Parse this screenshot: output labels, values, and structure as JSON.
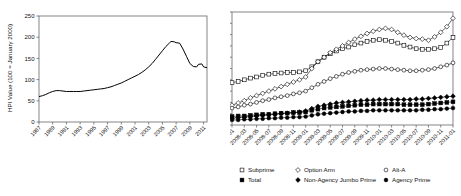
{
  "figure": {
    "panels": [
      "left-hpi-chart",
      "right-delinquency-chart"
    ]
  },
  "chart_data": [
    {
      "id": "hpi",
      "type": "line",
      "title": "",
      "xlabel": "",
      "ylabel": "HPI Value (100 = January 2000)",
      "ylim": [
        0,
        250
      ],
      "yticks": [
        "0",
        "50",
        "100",
        "150",
        "200",
        "250"
      ],
      "xticks": [
        "1987",
        "1989",
        "1991",
        "1993",
        "1995",
        "1997",
        "1999",
        "2001",
        "2003",
        "2005",
        "2007",
        "2009",
        "2011"
      ],
      "grid": false,
      "legend": "none",
      "x": [
        1987,
        1987.5,
        1988,
        1988.5,
        1989,
        1989.5,
        1990,
        1990.5,
        1991,
        1991.5,
        1992,
        1992.5,
        1993,
        1993.5,
        1994,
        1994.5,
        1995,
        1995.5,
        1996,
        1996.5,
        1997,
        1997.5,
        1998,
        1998.5,
        1999,
        1999.5,
        2000,
        2000.5,
        2001,
        2001.5,
        2002,
        2002.5,
        2003,
        2003.5,
        2004,
        2004.5,
        2005,
        2005.5,
        2006,
        2006.25,
        2006.75,
        2007,
        2007.5,
        2008,
        2008.5,
        2009,
        2009.5,
        2010,
        2010.25,
        2010.75,
        2011,
        2011.5
      ],
      "values": [
        60,
        62,
        65,
        69,
        72,
        74,
        74,
        73,
        72,
        72,
        72,
        72,
        72,
        73,
        74,
        75,
        76,
        77,
        78,
        79,
        81,
        83,
        86,
        89,
        92,
        96,
        100,
        104,
        108,
        112,
        117,
        123,
        130,
        138,
        148,
        158,
        168,
        178,
        186,
        190,
        189,
        187,
        186,
        172,
        155,
        138,
        131,
        130,
        136,
        137,
        130,
        128
      ],
      "series": [
        {
          "name": "HPI",
          "marker": "none",
          "style": "solid"
        }
      ]
    },
    {
      "id": "delinquency",
      "type": "line",
      "title": "",
      "xlabel": "",
      "ylabel": "",
      "ylim": [
        0,
        0.2
      ],
      "yticks": [
        "0%",
        "2%",
        "4%",
        "6%",
        "8%",
        "10%",
        "12%",
        "14%",
        "16%",
        "18%",
        "20%"
      ],
      "xticks": [
        "2008-01",
        "2008-03",
        "2008-05",
        "2008-07",
        "2008-09",
        "2008-11",
        "2009-01",
        "2009-03",
        "2009-05",
        "2009-07",
        "2009-09",
        "2009-11",
        "2010-01",
        "2010-03",
        "2010-05",
        "2010-07",
        "2010-09",
        "2010-11",
        "2011-01"
      ],
      "x": [
        "2008-01",
        "2008-02",
        "2008-03",
        "2008-04",
        "2008-05",
        "2008-06",
        "2008-07",
        "2008-08",
        "2008-09",
        "2008-10",
        "2008-11",
        "2008-12",
        "2009-01",
        "2009-02",
        "2009-03",
        "2009-04",
        "2009-05",
        "2009-06",
        "2009-07",
        "2009-08",
        "2009-09",
        "2009-10",
        "2009-11",
        "2009-12",
        "2010-01",
        "2010-02",
        "2010-03",
        "2010-04",
        "2010-05",
        "2010-06",
        "2010-07",
        "2010-08",
        "2010-09",
        "2010-10",
        "2010-11",
        "2010-12",
        "2011-01"
      ],
      "grid": false,
      "legend": "bottom",
      "series": [
        {
          "name": "Subprime",
          "marker": "open-square",
          "values": [
            7.5,
            7.7,
            8.0,
            8.3,
            8.5,
            8.8,
            9.0,
            9.1,
            9.2,
            9.3,
            9.3,
            9.4,
            9.6,
            10.3,
            11.2,
            12.0,
            12.6,
            13.1,
            13.5,
            13.8,
            14.2,
            14.5,
            14.8,
            15.0,
            15.1,
            15.0,
            14.8,
            14.5,
            14.1,
            13.8,
            13.5,
            13.4,
            13.4,
            13.5,
            13.7,
            14.5,
            15.5
          ]
        },
        {
          "name": "Option Arm",
          "marker": "open-diamond",
          "values": [
            3.5,
            3.9,
            4.3,
            4.8,
            5.2,
            5.6,
            6.0,
            6.4,
            6.8,
            7.2,
            7.6,
            8.0,
            8.5,
            10.0,
            11.2,
            12.0,
            12.8,
            13.4,
            14.0,
            14.6,
            15.2,
            15.7,
            16.2,
            16.6,
            16.9,
            17.1,
            16.9,
            16.4,
            15.9,
            15.5,
            15.3,
            15.2,
            15.0,
            15.6,
            16.4,
            17.4,
            18.9
          ]
        },
        {
          "name": "Alt-A",
          "marker": "open-circle",
          "values": [
            3.0,
            3.2,
            3.5,
            3.7,
            4.0,
            4.3,
            4.5,
            4.8,
            5.0,
            5.2,
            5.5,
            5.7,
            6.0,
            6.6,
            7.2,
            7.7,
            8.2,
            8.6,
            9.0,
            9.3,
            9.5,
            9.7,
            9.8,
            9.9,
            10.0,
            10.0,
            9.9,
            9.8,
            9.7,
            9.6,
            9.6,
            9.7,
            9.8,
            10.0,
            10.3,
            10.6,
            11.0
          ]
        },
        {
          "name": "Total",
          "marker": "filled-square",
          "values": [
            1.5,
            1.6,
            1.6,
            1.7,
            1.8,
            1.9,
            1.9,
            2.0,
            2.1,
            2.1,
            2.2,
            2.2,
            2.3,
            2.6,
            2.8,
            3.0,
            3.1,
            3.2,
            3.3,
            3.4,
            3.5,
            3.6,
            3.6,
            3.7,
            3.7,
            3.7,
            3.7,
            3.7,
            3.6,
            3.6,
            3.6,
            3.6,
            3.7,
            3.8,
            3.9,
            4.0,
            4.1
          ]
        },
        {
          "name": "Non-Agency Jumbo Prime",
          "marker": "filled-diamond",
          "values": [
            1.2,
            1.3,
            1.4,
            1.5,
            1.6,
            1.7,
            1.8,
            1.9,
            2.0,
            2.1,
            2.2,
            2.3,
            2.5,
            2.9,
            3.3,
            3.5,
            3.7,
            3.9,
            4.0,
            4.1,
            4.2,
            4.3,
            4.4,
            4.4,
            4.5,
            4.5,
            4.5,
            4.5,
            4.5,
            4.5,
            4.6,
            4.6,
            4.7,
            4.8,
            4.9,
            5.0,
            5.1
          ]
        },
        {
          "name": "Agency Prime",
          "marker": "filled-circle",
          "values": [
            0.9,
            0.9,
            1.0,
            1.0,
            1.1,
            1.1,
            1.2,
            1.2,
            1.3,
            1.3,
            1.4,
            1.4,
            1.5,
            1.7,
            1.9,
            2.0,
            2.1,
            2.2,
            2.3,
            2.4,
            2.4,
            2.5,
            2.5,
            2.6,
            2.6,
            2.6,
            2.6,
            2.6,
            2.6,
            2.6,
            2.6,
            2.7,
            2.7,
            2.8,
            2.8,
            2.9,
            3.0
          ]
        }
      ],
      "legend_entries": [
        {
          "label": "Subprime",
          "marker": "open-square"
        },
        {
          "label": "Option Arm",
          "marker": "open-diamond"
        },
        {
          "label": "Alt-A",
          "marker": "open-circle"
        },
        {
          "label": "Total",
          "marker": "filled-square"
        },
        {
          "label": "Non-Agency Jumbo Prime",
          "marker": "filled-diamond"
        },
        {
          "label": "Agency Prime",
          "marker": "filled-circle"
        }
      ]
    }
  ]
}
